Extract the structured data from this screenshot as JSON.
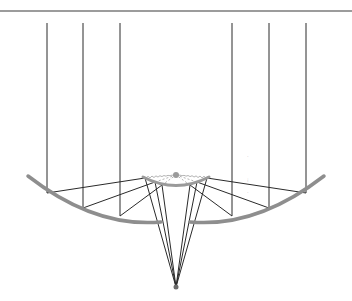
{
  "diagram": {
    "title": "",
    "colors": {
      "ray": "#2a2a2a",
      "primary_dish": "#8e8e8e",
      "secondary_reflector": "#9a9a9a",
      "guides": "#a0a0a0",
      "background": "#ffffff"
    },
    "top_line": {
      "x1": 0,
      "y1": 11,
      "x2": 352,
      "y2": 11
    },
    "focal_point": {
      "x": 176,
      "y": 287
    },
    "secondary_focus_dot": {
      "x": 176,
      "y": 175
    },
    "primary_left_path": "M28,176 Q95,228 161,222",
    "primary_right_path": "M190,222 Q257,228 324,176",
    "secondary_path": "M143,177 Q176,194 209,177",
    "rays": [
      {
        "x": 47,
        "top": 23,
        "dish_y": 193,
        "sub": [
          145,
          178
        ]
      },
      {
        "x": 83,
        "top": 23,
        "dish_y": 208,
        "sub": [
          155,
          182
        ]
      },
      {
        "x": 120,
        "top": 23,
        "dish_y": 216,
        "sub": [
          162,
          185
        ]
      },
      {
        "x": 232,
        "top": 23,
        "dish_y": 216,
        "sub": [
          190,
          185
        ]
      },
      {
        "x": 269,
        "top": 23,
        "dish_y": 208,
        "sub": [
          197,
          182
        ]
      },
      {
        "x": 306,
        "top": 23,
        "dish_y": 193,
        "sub": [
          207,
          178
        ]
      }
    ],
    "faint_marks": [
      {
        "x": 247,
        "y": 158,
        "text": "·"
      },
      {
        "x": 247,
        "y": 182,
        "text": "⁝"
      },
      {
        "x": 247,
        "y": 194,
        "text": "·"
      }
    ]
  }
}
